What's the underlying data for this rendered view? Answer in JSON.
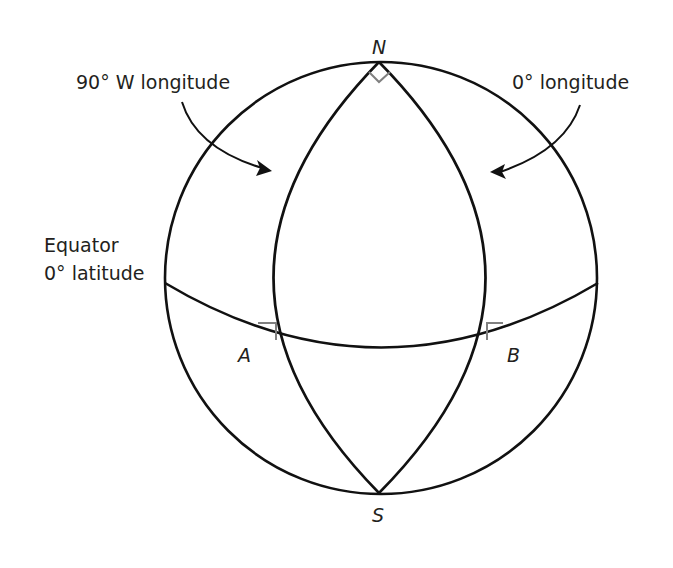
{
  "diagram": {
    "type": "sphere-geometry",
    "colors": {
      "stroke": "#111111",
      "right_angle_marker": "#808080",
      "text": "#231f20",
      "background": "#ffffff"
    },
    "points": {
      "north": "N",
      "south": "S",
      "a": "A",
      "b": "B"
    },
    "labels": {
      "meridian_west": "90° W longitude",
      "meridian_prime": "0° longitude",
      "equator_line1": "Equator",
      "equator_line2": "0° latitude"
    },
    "right_angles": [
      "N",
      "A",
      "B"
    ]
  }
}
